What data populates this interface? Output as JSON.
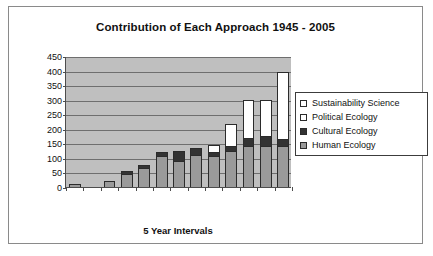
{
  "frame": {
    "border_color": "#8a8a8a"
  },
  "chart_data": {
    "type": "bar",
    "subtype": "stacked-bar",
    "title": "Contribution of Each Approach 1945 - 2005",
    "xlabel": "5 Year Intervals",
    "ylabel": "",
    "ylim": [
      0,
      450
    ],
    "ytick_step": 50,
    "yticks": [
      0,
      50,
      100,
      150,
      200,
      250,
      300,
      350,
      400,
      450
    ],
    "ytick_labels": [
      "0",
      "50",
      "100",
      "150",
      "200",
      "250",
      "300",
      "350",
      "400",
      "450"
    ],
    "grid": true,
    "grid_axis": "y",
    "xtick_labels": [],
    "xtick_count": 13,
    "categories": [
      "1",
      "2",
      "3",
      "4",
      "5",
      "6",
      "7",
      "8",
      "9",
      "10",
      "11",
      "12",
      "13"
    ],
    "legend_position": "right",
    "plot_background": "#bfbfbf",
    "series": [
      {
        "name": "Human Ecology",
        "color": "#9a9a9a",
        "values": [
          10,
          0,
          20,
          45,
          65,
          105,
          90,
          110,
          105,
          125,
          140,
          140,
          140
        ]
      },
      {
        "name": "Cultural Ecology",
        "color": "#333333",
        "values": [
          0,
          0,
          0,
          10,
          10,
          15,
          35,
          25,
          15,
          15,
          30,
          35,
          25
        ]
      },
      {
        "name": "Political Ecology",
        "color": "#ffffff",
        "values": [
          0,
          0,
          0,
          0,
          0,
          0,
          0,
          0,
          25,
          75,
          130,
          125,
          230
        ]
      },
      {
        "name": "Sustainability Science",
        "color": "#ffffff",
        "values": [
          0,
          0,
          0,
          0,
          0,
          0,
          0,
          0,
          0,
          0,
          0,
          0,
          0
        ]
      }
    ]
  },
  "legend": {
    "items": [
      {
        "label": "Sustainability Science",
        "swatch": "#ffffff"
      },
      {
        "label": "Political Ecology",
        "swatch": "#ffffff"
      },
      {
        "label": "Cultural Ecology",
        "swatch": "#333333"
      },
      {
        "label": "Human Ecology",
        "swatch": "#9a9a9a"
      }
    ]
  }
}
